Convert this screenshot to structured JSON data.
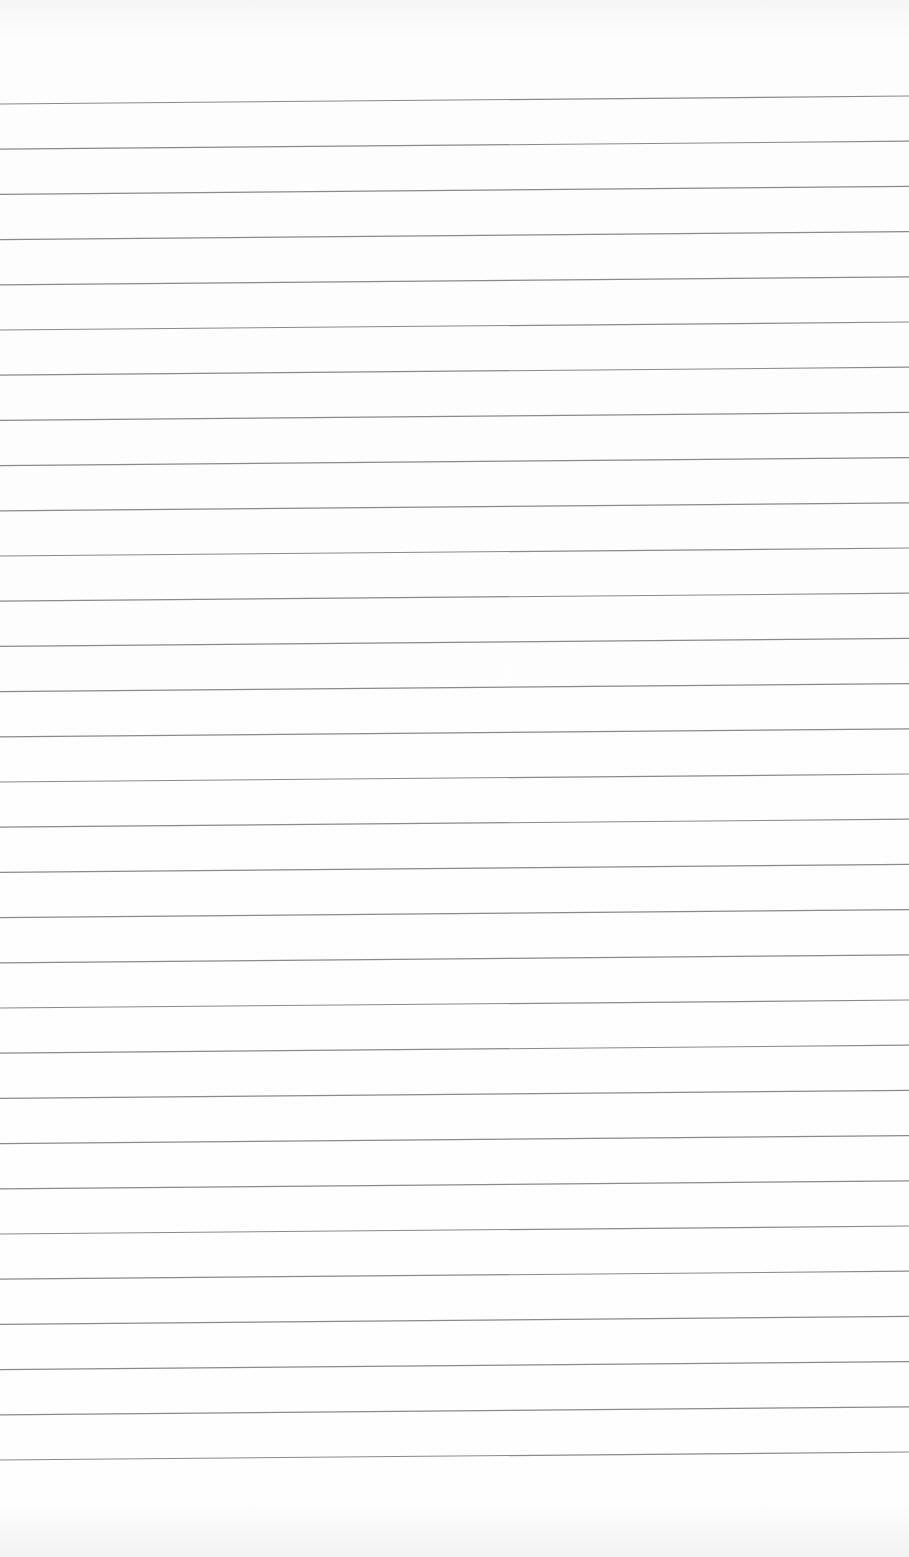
{
  "paper": {
    "type": "lined-paper",
    "background_color": "#fdfdfd",
    "line_color": "#8a8a8a",
    "line_count": 31,
    "first_line_y_left": 104,
    "first_line_y_right": 96,
    "line_spacing": 45.2,
    "line_width": 1.2
  }
}
